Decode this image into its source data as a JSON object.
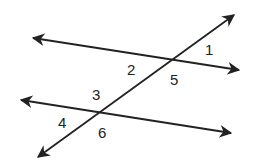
{
  "diagram": {
    "line_color": "#222222",
    "angle_labels": [
      {
        "id": "1",
        "text": "1"
      },
      {
        "id": "2",
        "text": "2"
      },
      {
        "id": "3",
        "text": "3"
      },
      {
        "id": "4",
        "text": "4"
      },
      {
        "id": "5",
        "text": "5"
      },
      {
        "id": "6",
        "text": "6"
      }
    ]
  }
}
